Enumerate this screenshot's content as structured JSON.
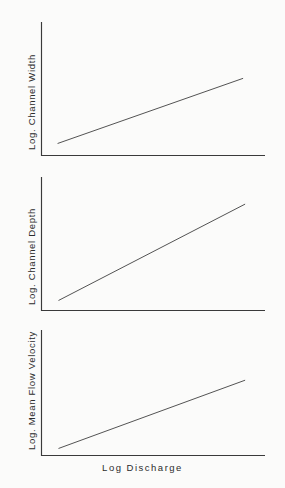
{
  "figure": {
    "background_color": "#fbfbfa",
    "axis_color": "#3a3a3a",
    "line_color": "#4a4a4a",
    "shared_xlabel": "Log  Discharge"
  },
  "chart_data": [
    {
      "type": "line",
      "id": "channel-width",
      "title": "",
      "xlabel": "Log  Discharge",
      "ylabel": "Log. Channel Width",
      "grid": false,
      "legend": "none",
      "xlim": [
        0,
        1
      ],
      "ylim": [
        0,
        1
      ],
      "series": [
        {
          "name": "Log. Channel Width vs Log Discharge",
          "x": [
            0.072,
            0.902
          ],
          "y": [
            0.09,
            0.578
          ]
        }
      ],
      "annotations": []
    },
    {
      "type": "line",
      "id": "channel-depth",
      "title": "",
      "xlabel": "Log  Discharge",
      "ylabel": "Log. Channel Depth",
      "grid": false,
      "legend": "none",
      "xlim": [
        0,
        1
      ],
      "ylim": [
        0,
        1
      ],
      "series": [
        {
          "name": "Log. Channel Depth vs Log Discharge",
          "x": [
            0.076,
            0.911
          ],
          "y": [
            0.075,
            0.797
          ]
        }
      ],
      "annotations": []
    },
    {
      "type": "line",
      "id": "mean-flow-velocity",
      "title": "",
      "xlabel": "Log  Discharge",
      "ylabel": "Log. Mean Flow Velocity",
      "grid": false,
      "legend": "none",
      "xlim": [
        0,
        1
      ],
      "ylim": [
        0,
        1
      ],
      "series": [
        {
          "name": "Log. Mean Flow Velocity vs Log Discharge",
          "x": [
            0.076,
            0.911
          ],
          "y": [
            0.056,
            0.6
          ]
        }
      ],
      "annotations": []
    }
  ],
  "panels": {
    "width": {
      "ylabel": "Log. Channel Width"
    },
    "depth": {
      "ylabel": "Log. Channel Depth"
    },
    "velocity": {
      "ylabel": "Log. Mean Flow Velocity"
    }
  },
  "axis": {
    "xlabel": "Log  Discharge"
  }
}
